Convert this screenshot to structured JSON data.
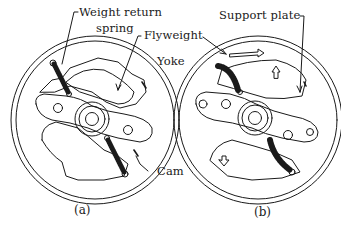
{
  "figure": {
    "panels": [
      {
        "id": "a",
        "caption": "(a)"
      },
      {
        "id": "b",
        "caption": "(b)"
      }
    ],
    "labels": {
      "weight_return_spring_1": "Weight return",
      "weight_return_spring_2": "spring",
      "flyweight": "Flyweight",
      "yoke": "Yoke",
      "support_plate": "Support plate",
      "cam": "Cam"
    },
    "colors": {
      "line": "#1a1a1a",
      "background": "#ffffff"
    }
  }
}
